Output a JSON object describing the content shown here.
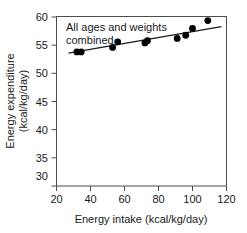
{
  "chart_data": {
    "type": "scatter",
    "title": "",
    "annotation": "All ages and weights combined",
    "annotation_lines": [
      "All ages and weights",
      "combined"
    ],
    "xlabel": "Energy intake (kcal/kg/day)",
    "ylabel": "Energy expenditure (kcal/kg/day)",
    "ylabel_lines": [
      "Energy expenditure",
      "(kcal/kg/day)"
    ],
    "xlim": [
      20,
      120
    ],
    "ylim": [
      28,
      60
    ],
    "xticks": [
      20,
      40,
      60,
      80,
      100,
      120
    ],
    "yticks": [
      30,
      35,
      40,
      45,
      50,
      55,
      60
    ],
    "xtick_labels": [
      "20",
      "40",
      "60",
      "80",
      "100",
      "120"
    ],
    "ytick_labels": [
      "30",
      "35",
      "40",
      "45",
      "50",
      "55",
      "60"
    ],
    "grid": false,
    "legend": "none",
    "marker": "filled-circle",
    "marker_color": "#000000",
    "point_count": 10,
    "points": [
      {
        "x": 32.0,
        "y": 29.0
      },
      {
        "x": 34.5,
        "y": 29.0
      },
      {
        "x": 53.0,
        "y": 33.0
      },
      {
        "x": 56.0,
        "y": 38.0
      },
      {
        "x": 72.0,
        "y": 37.0
      },
      {
        "x": 73.5,
        "y": 39.0
      },
      {
        "x": 91.0,
        "y": 41.0
      },
      {
        "x": 96.0,
        "y": 43.8
      },
      {
        "x": 100.0,
        "y": 49.9
      },
      {
        "x": 109.0,
        "y": 56.8
      }
    ],
    "x": [
      32.0,
      34.5,
      53.0,
      56.0,
      72.0,
      73.5,
      91.0,
      96.0,
      100.0,
      109.0
    ],
    "values": [
      29.0,
      29.0,
      33.0,
      38.0,
      37.0,
      39.0,
      41.0,
      43.8,
      49.9,
      56.8
    ],
    "fit_line": {
      "type": "linear-regression",
      "x_start": 27.0,
      "y_start": 28.0,
      "x_end": 117.0,
      "y_end": 51.5,
      "color": "#1a1a1a"
    },
    "colors": {
      "frame": "#4d4d4d",
      "marker": "#000000",
      "line": "#1a1a1a",
      "text": "#1a1a1a",
      "background": "#ffffff"
    }
  }
}
